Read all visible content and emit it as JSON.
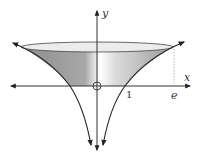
{
  "figure": {
    "axes": {
      "x_label": "x",
      "y_label": "y",
      "origin_marker": "O"
    },
    "ticks": {
      "x_one": "1",
      "x_e": "e"
    },
    "colors": {
      "axis": "#333333",
      "curve": "#222222",
      "shade_dark": "#9a9a9a",
      "shade_light": "#ffffff",
      "disc_top": "#e6e6e6",
      "dotted_guide": "#999999"
    }
  }
}
